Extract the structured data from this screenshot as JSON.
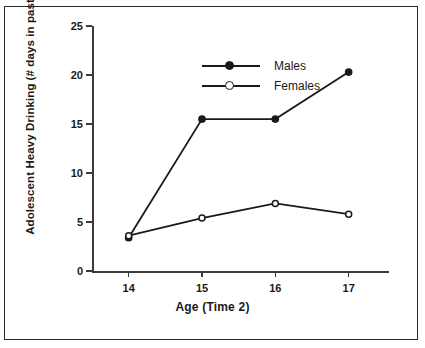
{
  "chart_data": {
    "type": "line",
    "title": "",
    "xlabel": "Age (Time 2)",
    "ylabel_line1": "Adolescent Heavy Drinking",
    "ylabel_line2": "(# days in past year consumed 5+ drinks)",
    "categories": [
      "14",
      "15",
      "16",
      "17"
    ],
    "x": [
      14,
      15,
      16,
      17
    ],
    "series": [
      {
        "name": "Males",
        "values": [
          3.4,
          15.5,
          15.5,
          20.3
        ],
        "marker": "filled-circle"
      },
      {
        "name": "Females",
        "values": [
          3.6,
          5.4,
          6.9,
          5.8
        ],
        "marker": "open-circle"
      }
    ],
    "ylim": [
      0,
      25
    ],
    "yticks": [
      "0",
      "5",
      "10",
      "15",
      "20",
      "25"
    ],
    "ytick_values": [
      0,
      5,
      10,
      15,
      20,
      25
    ],
    "xtick_labels": [
      "14",
      "15",
      "16",
      "17"
    ],
    "grid": false,
    "legend_position": "top-left",
    "line_color": "#1a1a1a",
    "axis_color": "#3a3a3a",
    "background_color": "#ffffff"
  },
  "legend": {
    "entries": [
      {
        "label": "Males",
        "marker": "filled-circle"
      },
      {
        "label": "Females",
        "marker": "open-circle"
      }
    ]
  }
}
